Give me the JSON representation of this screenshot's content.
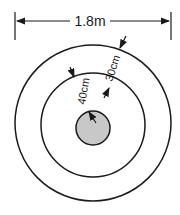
{
  "diagram": {
    "type": "concentric-circles-dimension",
    "width_label": "1.8m",
    "gap_outer_label": "30cm",
    "gap_inner_label": "40cm",
    "colors": {
      "line": "#1a1a1a",
      "center_fill": "#c8c8c8",
      "background": "#ffffff"
    }
  }
}
